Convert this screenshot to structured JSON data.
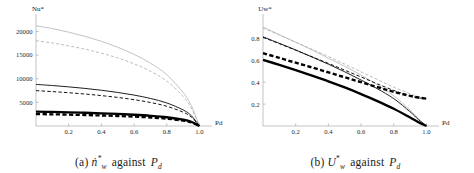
{
  "figure": {
    "background_color": "#ffffff",
    "panel_count": 2
  },
  "panels": [
    {
      "id": "panel-a",
      "caption_prefix": "(a)",
      "caption_symbol": "n",
      "caption_symbol_sub": "w",
      "caption_symbol_sup": "*",
      "caption_verb": "against",
      "caption_x_symbol": "P",
      "caption_x_sub": "d",
      "caption_full": "(a) ṅ*w against Pd"
    },
    {
      "id": "panel-b",
      "caption_prefix": "(b)",
      "caption_symbol": "U",
      "caption_symbol_sub": "w",
      "caption_symbol_sup": "*",
      "caption_verb": "against",
      "caption_x_symbol": "P",
      "caption_x_sub": "d",
      "caption_full": "(b) U*w against Pd"
    }
  ],
  "chart_data": [
    {
      "type": "line",
      "id": "chart-a",
      "title": "",
      "xlabel": "Pd",
      "xlabel_symbol": "P",
      "xlabel_sub": "d",
      "ylabel": "Nu*",
      "ylabel_symbol": "Nu",
      "ylabel_sup": "*",
      "xlim": [
        0,
        1.04
      ],
      "ylim": [
        0,
        22000
      ],
      "grid": false,
      "legend_position": "none",
      "xticks": [
        0.2,
        0.4,
        0.6,
        0.8,
        1.0
      ],
      "xticklabels": [
        "0.2",
        "0.4",
        "0.6",
        "0.8",
        "1.0"
      ],
      "yticks": [
        5000,
        10000,
        15000,
        20000
      ],
      "yticklabels": [
        "5000",
        "10000",
        "15000",
        "20000"
      ],
      "x": [
        0.0,
        0.1,
        0.2,
        0.3,
        0.4,
        0.5,
        0.6,
        0.7,
        0.8,
        0.9,
        0.95,
        1.0
      ],
      "series": [
        {
          "name": "light-solid",
          "style": "solid",
          "color": "#b4b4b4",
          "width": 0.8,
          "values": [
            21200,
            20600,
            19850,
            18950,
            17900,
            16650,
            15150,
            13300,
            10850,
            7100,
            4300,
            0
          ]
        },
        {
          "name": "light-dashed",
          "style": "dashed",
          "color": "#b4b4b4",
          "width": 0.9,
          "values": [
            18050,
            17550,
            16950,
            16250,
            15400,
            14400,
            13150,
            11600,
            9500,
            6250,
            3800,
            0
          ]
        },
        {
          "name": "medium-solid",
          "style": "solid",
          "color": "#141414",
          "width": 0.95,
          "values": [
            8800,
            8560,
            8280,
            7950,
            7560,
            7100,
            6540,
            5830,
            4880,
            3400,
            2200,
            0
          ]
        },
        {
          "name": "medium-dashed",
          "style": "dashed",
          "color": "#141414",
          "width": 1.0,
          "values": [
            7480,
            7280,
            7040,
            6760,
            6430,
            6040,
            5570,
            4970,
            4170,
            2920,
            1900,
            0
          ]
        },
        {
          "name": "thick-solid",
          "style": "solid",
          "color": "#000000",
          "width": 2.3,
          "values": [
            3050,
            2980,
            2900,
            2800,
            2690,
            2550,
            2380,
            2160,
            1850,
            1340,
            900,
            0
          ]
        },
        {
          "name": "thick-dashed",
          "style": "dashed",
          "color": "#000000",
          "width": 2.3,
          "values": [
            2520,
            2470,
            2400,
            2320,
            2230,
            2120,
            1980,
            1800,
            1550,
            1130,
            770,
            0
          ]
        }
      ]
    },
    {
      "type": "line",
      "id": "chart-b",
      "title": "",
      "xlabel": "Pd",
      "xlabel_symbol": "P",
      "xlabel_sub": "d",
      "ylabel": "Uw*",
      "ylabel_symbol": "U",
      "ylabel_sub": "w",
      "ylabel_sup": "*",
      "xlim": [
        0,
        1.04
      ],
      "ylim": [
        0,
        0.95
      ],
      "grid": false,
      "legend_position": "none",
      "xticks": [
        0.2,
        0.4,
        0.6,
        0.8,
        1.0
      ],
      "xticklabels": [
        "0.2",
        "0.4",
        "0.6",
        "0.8",
        "1.0"
      ],
      "yticks": [
        0.2,
        0.4,
        0.6,
        0.8
      ],
      "yticklabels": [
        "0.2",
        "0.4",
        "0.6",
        "0.8"
      ],
      "x": [
        0.0,
        0.1,
        0.2,
        0.3,
        0.4,
        0.5,
        0.6,
        0.7,
        0.8,
        0.9,
        0.95,
        1.0
      ],
      "series": [
        {
          "name": "light-solid",
          "style": "solid",
          "color": "#b4b4b4",
          "width": 0.8,
          "values": [
            0.905,
            0.835,
            0.765,
            0.695,
            0.62,
            0.545,
            0.465,
            0.375,
            0.275,
            0.145,
            0.07,
            0.0
          ]
        },
        {
          "name": "light-dashed",
          "style": "dashed",
          "color": "#b4b4b4",
          "width": 0.9,
          "values": [
            0.895,
            0.83,
            0.765,
            0.7,
            0.635,
            0.565,
            0.495,
            0.425,
            0.355,
            0.295,
            0.27,
            0.255
          ]
        },
        {
          "name": "medium-solid",
          "style": "solid",
          "color": "#141414",
          "width": 0.95,
          "values": [
            0.815,
            0.755,
            0.695,
            0.63,
            0.565,
            0.495,
            0.42,
            0.34,
            0.25,
            0.13,
            0.06,
            0.0
          ]
        },
        {
          "name": "medium-dashed",
          "style": "dashed",
          "color": "#141414",
          "width": 1.0,
          "values": [
            0.81,
            0.752,
            0.692,
            0.632,
            0.572,
            0.51,
            0.448,
            0.385,
            0.325,
            0.275,
            0.258,
            0.25
          ]
        },
        {
          "name": "thick-dashed",
          "style": "dashed",
          "color": "#000000",
          "width": 2.4,
          "values": [
            0.665,
            0.622,
            0.578,
            0.535,
            0.49,
            0.445,
            0.4,
            0.355,
            0.312,
            0.275,
            0.26,
            0.25
          ]
        },
        {
          "name": "thick-solid",
          "style": "solid",
          "color": "#000000",
          "width": 2.4,
          "values": [
            0.605,
            0.558,
            0.51,
            0.46,
            0.408,
            0.352,
            0.292,
            0.228,
            0.158,
            0.078,
            0.035,
            0.0
          ]
        }
      ]
    }
  ]
}
